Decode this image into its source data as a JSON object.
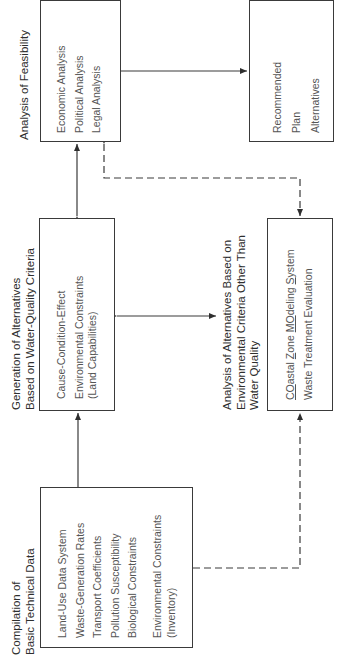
{
  "diagram": {
    "orientation": "rotated-90-ccw",
    "nodes": {
      "compilation": {
        "heading": [
          "Compilation of",
          "Basic Technical Data"
        ],
        "items": [
          "Land-Use Data System",
          "Waste-Generation Rates",
          "Transport Coefficients",
          "Pollution Susceptibility",
          "Biological Constraints"
        ],
        "items2": [
          "Environmental Constraints",
          "(Inventory)"
        ]
      },
      "generation": {
        "heading": [
          "Generation of Alternatives",
          "Based on Water-Quality Criteria"
        ],
        "items": [
          "Cause-Condition-Effect",
          "Environmental Constraints",
          "(Land Capabilities)"
        ]
      },
      "feasibility": {
        "heading": [
          "Analysis of Feasibility"
        ],
        "items": [
          "Economic Analysis",
          "Political Analysis",
          "Legal Analysis"
        ]
      },
      "recommended": {
        "items": [
          "Recommended",
          "Plan",
          "Alternatives"
        ]
      },
      "environmental": {
        "heading": [
          "Analysis of Alternatives Based on",
          "Environmental Criteria Other Than",
          "Water Quality"
        ],
        "items_parts": {
          "czm": {
            "co": "CO",
            "astal": "astal ",
            "z": "Z",
            "one": "one ",
            "mo": "MO",
            "deling": "deling ",
            "s": "S",
            "ystem": "ystem"
          },
          "waste": "Waste Treatment Evaluation"
        }
      }
    },
    "edges": [
      {
        "from": "compilation",
        "to": "generation",
        "style": "solid",
        "arrow": "end"
      },
      {
        "from": "generation",
        "to": "feasibility",
        "style": "solid",
        "arrow": "both"
      },
      {
        "from": "generation",
        "to": "environmental",
        "style": "solid",
        "arrow": "both"
      },
      {
        "from": "feasibility",
        "to": "recommended",
        "style": "solid",
        "arrow": "end"
      },
      {
        "from": "feasibility",
        "to": "environmental",
        "style": "dashed",
        "arrow": "both"
      },
      {
        "from": "compilation",
        "to": "environmental",
        "style": "dashed",
        "arrow": "end"
      }
    ]
  }
}
